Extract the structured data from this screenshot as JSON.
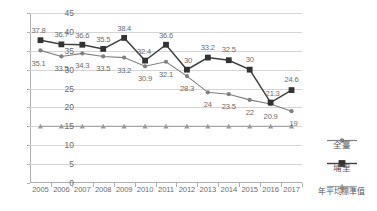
{
  "chart_data": {
    "type": "line",
    "title": "",
    "xlabel": "",
    "ylabel": "",
    "ylim": [
      0,
      45
    ],
    "ytick_step": 5,
    "yticks": [
      "0",
      "5",
      "10",
      "15",
      "20",
      "25",
      "30",
      "35",
      "40",
      "45"
    ],
    "grid": true,
    "legend_position": "right",
    "categories": [
      "2005",
      "2006",
      "2007",
      "2008",
      "2009",
      "2010",
      "2011",
      "2012",
      "2013",
      "2014",
      "2015",
      "2016",
      "2017"
    ],
    "series": [
      {
        "name": "全臺",
        "marker": "circle",
        "color": "#808080",
        "values": [
          35.1,
          33.5,
          34.3,
          33.5,
          33.2,
          30.9,
          32.1,
          28.3,
          24,
          23.5,
          22,
          20.9,
          19
        ],
        "labels": [
          "35.1",
          "33.5",
          "34.3",
          "33.5",
          "33.2",
          "30.9",
          "32.1",
          "28.3",
          "24",
          "23.5",
          "22",
          "20.9",
          "19"
        ]
      },
      {
        "name": "埔里",
        "marker": "square",
        "color": "#404040",
        "values": [
          37.8,
          36.7,
          36.6,
          35.5,
          38.4,
          32.4,
          36.6,
          30,
          33.2,
          32.5,
          30,
          21.3,
          24.6
        ],
        "labels": [
          "37.8",
          "36.7",
          "36.6",
          "35.5",
          "38.4",
          "32.4",
          "36.6",
          "30",
          "33.2",
          "32.5",
          "30",
          "21.3",
          "24.6"
        ]
      },
      {
        "name": "年平均標準值",
        "marker": "triangle",
        "color": "#a6a6a6",
        "values": [
          15,
          15,
          15,
          15,
          15,
          15,
          15,
          15,
          15,
          15,
          15,
          15,
          15
        ],
        "labels": [
          "",
          "",
          "",
          "",
          "",
          "",
          "",
          "",
          "",
          "",
          "",
          "",
          ""
        ]
      }
    ]
  },
  "legend": {
    "items": [
      {
        "label": "全臺"
      },
      {
        "label": "埔里"
      },
      {
        "label": "年平均標準值"
      }
    ]
  },
  "colors": {
    "grid": "#d6d6d6",
    "axis": "#b0b0b0",
    "text": "#6b6b6b",
    "series_all_taiwan": "#808080",
    "series_puli": "#404040",
    "series_standard": "#a6a6a6"
  }
}
